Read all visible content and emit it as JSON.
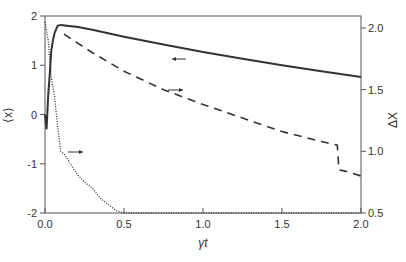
{
  "chart_data": {
    "type": "line",
    "title": "",
    "xlabel": "γt",
    "ylabel_left": "⟨x⟩",
    "ylabel_right": "ΔX",
    "xlim": [
      0.0,
      2.0
    ],
    "ylim_left": [
      -2,
      2
    ],
    "ylim_right": [
      0.5,
      2.1
    ],
    "xticks": [
      "0.0",
      "0.5",
      "1.0",
      "1.5",
      "2.0"
    ],
    "yticks_left": [
      "-2",
      "-1",
      "0",
      "1",
      "2"
    ],
    "yticks_right": [
      "0.5",
      "1.0",
      "1.5",
      "2.0"
    ],
    "grid": false,
    "legend": "none (arrows indicate axis)",
    "series": [
      {
        "name": "⟨x⟩ (solid)",
        "axis": "left",
        "style": "solid",
        "arrow": "left",
        "x": [
          0.0,
          0.01,
          0.02,
          0.03,
          0.04,
          0.05,
          0.06,
          0.08,
          0.1,
          0.15,
          0.2,
          0.3,
          0.4,
          0.5,
          0.75,
          1.0,
          1.25,
          1.5,
          1.75,
          2.0
        ],
        "y": [
          0.0,
          -0.3,
          0.4,
          0.8,
          1.3,
          1.5,
          1.65,
          1.8,
          1.82,
          1.8,
          1.78,
          1.72,
          1.65,
          1.58,
          1.42,
          1.27,
          1.13,
          1.0,
          0.88,
          0.76
        ]
      },
      {
        "name": "ΔX (dashed)",
        "axis": "right",
        "style": "dashed",
        "arrow": "right",
        "x": [
          0.12,
          0.3,
          0.5,
          0.75,
          1.0,
          1.25,
          1.5,
          1.75,
          1.85,
          1.86,
          1.9,
          2.0
        ],
        "y": [
          1.95,
          1.8,
          1.65,
          1.5,
          1.38,
          1.27,
          1.16,
          1.08,
          1.05,
          0.85,
          0.84,
          0.8
        ]
      },
      {
        "name": "ΔX (dotted)",
        "axis": "right",
        "style": "dotted",
        "arrow": "right",
        "x": [
          0.0,
          0.02,
          0.04,
          0.06,
          0.08,
          0.1,
          0.12,
          0.15,
          0.2,
          0.25,
          0.3,
          0.35,
          0.4,
          0.45,
          0.5,
          1.0,
          1.5,
          2.0
        ],
        "y": [
          2.05,
          1.9,
          1.6,
          1.45,
          1.2,
          1.0,
          0.98,
          0.92,
          0.82,
          0.75,
          0.7,
          0.62,
          0.57,
          0.52,
          0.5,
          0.5,
          0.5,
          0.5
        ]
      }
    ]
  }
}
